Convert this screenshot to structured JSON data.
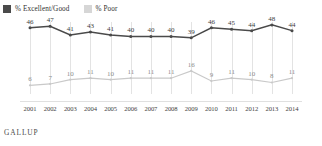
{
  "legend": {
    "items": [
      {
        "label": "% Excellent/Good",
        "color": "#4a4a4a",
        "icon": "legend-swatch-icon"
      },
      {
        "label": "% Poor",
        "color": "#d6d6d6",
        "icon": "legend-swatch-icon"
      }
    ]
  },
  "footer": {
    "brand": "GALLUP"
  },
  "chart_data": {
    "type": "line",
    "title": "",
    "xlabel": "",
    "ylabel": "",
    "grid": true,
    "legend_position": "top-left",
    "ylim": [
      0,
      50
    ],
    "categories": [
      "2001",
      "2002",
      "2003",
      "2004",
      "2005",
      "2006",
      "2007",
      "2008",
      "2009",
      "2010",
      "2011",
      "2012",
      "2013",
      "2014"
    ],
    "series": [
      {
        "name": "% Excellent/Good",
        "color": "#4a4a4a",
        "values": [
          46,
          47,
          41,
          43,
          41,
          40,
          40,
          40,
          39,
          46,
          45,
          44,
          48,
          44
        ]
      },
      {
        "name": "% Poor",
        "color": "#c9c9c9",
        "values": [
          6,
          7,
          10,
          11,
          10,
          11,
          11,
          11,
          16,
          9,
          11,
          10,
          8,
          11
        ]
      }
    ]
  }
}
